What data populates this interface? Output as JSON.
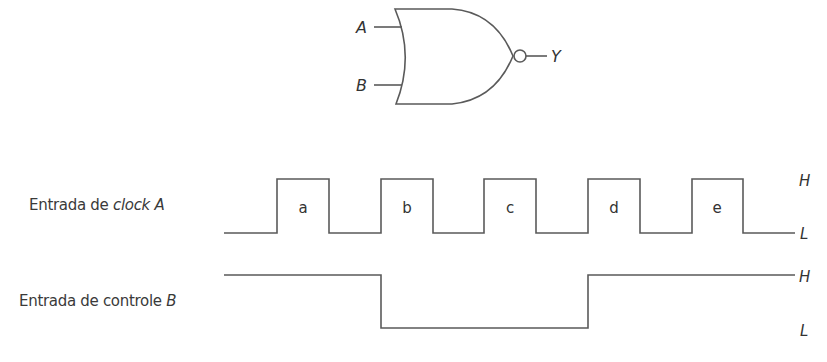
{
  "gate": {
    "type": "NOR",
    "input_a": "A",
    "input_b": "B",
    "output": "Y"
  },
  "signals": [
    {
      "label_prefix": "Entrada de ",
      "label_italic": "clock A",
      "high_label": "H",
      "low_label": "L",
      "pulse_labels": [
        "a",
        "b",
        "c",
        "d",
        "e"
      ]
    },
    {
      "label_prefix": "Entrada de controle ",
      "label_italic": "B",
      "high_label": "H",
      "low_label": "L"
    }
  ],
  "colors": {
    "stroke": "#5a5a5a",
    "text": "#333333",
    "background": "#ffffff"
  }
}
